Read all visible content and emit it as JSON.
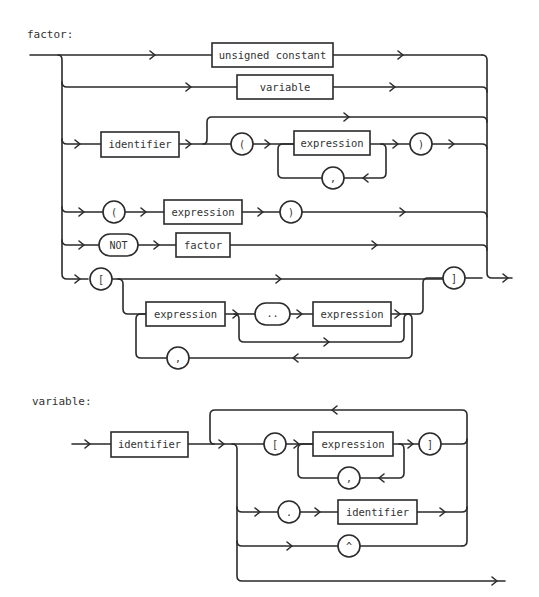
{
  "header": {
    "text": ""
  },
  "diagrams": [
    {
      "title": "factor:",
      "rows": [
        {
          "id": "unsigned-constant",
          "items": [
            {
              "kind": "nonterminal",
              "label": "unsigned constant"
            }
          ]
        },
        {
          "id": "variable",
          "items": [
            {
              "kind": "nonterminal",
              "label": "variable"
            }
          ]
        },
        {
          "id": "function-call",
          "items": [
            {
              "kind": "nonterminal",
              "label": "identifier"
            },
            {
              "kind": "terminal",
              "label": "("
            },
            {
              "kind": "nonterminal",
              "label": "expression"
            },
            {
              "kind": "terminal",
              "label": ","
            },
            {
              "kind": "terminal",
              "label": ")"
            }
          ]
        },
        {
          "id": "parenthesized",
          "items": [
            {
              "kind": "terminal",
              "label": "("
            },
            {
              "kind": "nonterminal",
              "label": "expression"
            },
            {
              "kind": "terminal",
              "label": ")"
            }
          ]
        },
        {
          "id": "not-factor",
          "items": [
            {
              "kind": "terminal",
              "label": "NOT"
            },
            {
              "kind": "nonterminal",
              "label": "factor"
            }
          ]
        },
        {
          "id": "set",
          "items": [
            {
              "kind": "terminal",
              "label": "["
            },
            {
              "kind": "nonterminal",
              "label": "expression"
            },
            {
              "kind": "terminal",
              "label": ".."
            },
            {
              "kind": "nonterminal",
              "label": "expression"
            },
            {
              "kind": "terminal",
              "label": ","
            },
            {
              "kind": "terminal",
              "label": "]"
            }
          ]
        }
      ]
    },
    {
      "title": "variable:",
      "rows": [
        {
          "id": "base",
          "items": [
            {
              "kind": "nonterminal",
              "label": "identifier"
            }
          ]
        },
        {
          "id": "index",
          "items": [
            {
              "kind": "terminal",
              "label": "["
            },
            {
              "kind": "nonterminal",
              "label": "expression"
            },
            {
              "kind": "terminal",
              "label": ","
            },
            {
              "kind": "terminal",
              "label": "]"
            }
          ]
        },
        {
          "id": "field",
          "items": [
            {
              "kind": "terminal",
              "label": "."
            },
            {
              "kind": "nonterminal",
              "label": "identifier"
            }
          ]
        },
        {
          "id": "pointer",
          "items": [
            {
              "kind": "terminal",
              "label": "^"
            }
          ]
        }
      ]
    }
  ],
  "colors": {
    "ink": "#2a2a2a",
    "paper": "#ffffff"
  }
}
